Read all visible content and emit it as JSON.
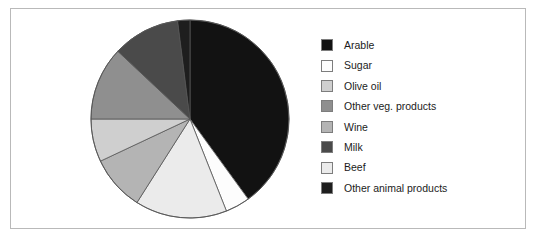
{
  "figure": {
    "border_color": "#b9b9b9",
    "background": "#ffffff"
  },
  "chart_data": {
    "type": "pie",
    "title": "",
    "subtitle": "",
    "xlabel": "",
    "ylabel": "",
    "grid": false,
    "legend_position": "right",
    "start_angle_deg": 0,
    "direction": "clockwise",
    "categories": [
      "Arable",
      "Sugar",
      "Olive oil",
      "Other veg. products",
      "Wine",
      "Milk",
      "Beef",
      "Other animal products"
    ],
    "values": [
      40,
      4,
      7,
      12,
      9,
      11,
      15,
      2
    ],
    "unit": "percent",
    "colors": [
      "#121212",
      "#fdfdfd",
      "#cfcfcf",
      "#8f8f8f",
      "#b4b4b4",
      "#4a4a4a",
      "#ebebeb",
      "#1e1e1e"
    ],
    "slice_edge_color": "#555555",
    "slices": [
      {
        "label": "Arable",
        "value": 40,
        "color": "#121212"
      },
      {
        "label": "Sugar",
        "value": 4,
        "color": "#fdfdfd"
      },
      {
        "label": "Beef",
        "value": 15,
        "color": "#ebebeb"
      },
      {
        "label": "Wine",
        "value": 9,
        "color": "#b4b4b4"
      },
      {
        "label": "Olive oil",
        "value": 7,
        "color": "#cfcfcf"
      },
      {
        "label": "Other veg. products",
        "value": 12,
        "color": "#8f8f8f"
      },
      {
        "label": "Milk",
        "value": 11,
        "color": "#4a4a4a"
      },
      {
        "label": "Other animal products",
        "value": 2,
        "color": "#1e1e1e"
      }
    ]
  },
  "legend": {
    "items": [
      {
        "label": "Arable",
        "color": "#121212"
      },
      {
        "label": "Sugar",
        "color": "#fdfdfd"
      },
      {
        "label": "Olive oil",
        "color": "#cfcfcf"
      },
      {
        "label": "Other veg. products",
        "color": "#8f8f8f"
      },
      {
        "label": "Wine",
        "color": "#b4b4b4"
      },
      {
        "label": "Milk",
        "color": "#4a4a4a"
      },
      {
        "label": "Beef",
        "color": "#ebebeb"
      },
      {
        "label": "Other animal products",
        "color": "#1e1e1e"
      }
    ]
  }
}
